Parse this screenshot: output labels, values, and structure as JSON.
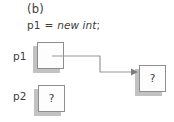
{
  "figure": {
    "panel_label": "(b)",
    "code": {
      "target": "p1",
      "operator": "=",
      "keyword": "new int",
      "terminator": ";",
      "full_text": "p1 = new int;"
    },
    "variables": [
      {
        "name": "p1",
        "label": "p1",
        "cell_value": "",
        "has_pointer": true,
        "points_to": "heap-cell"
      },
      {
        "name": "p2",
        "label": "p2",
        "cell_value": "?",
        "has_pointer": false,
        "points_to": ""
      }
    ],
    "heap_cell": {
      "name": "heap-cell",
      "value": "?"
    },
    "colors": {
      "cell_border": "#8e8e8e",
      "cell_fill": "#fdfdfd",
      "cell_shadow": "#c2c2c2",
      "text": "#3d3d3d",
      "connector": "#9a9a9a",
      "background": "#ffffff"
    }
  }
}
